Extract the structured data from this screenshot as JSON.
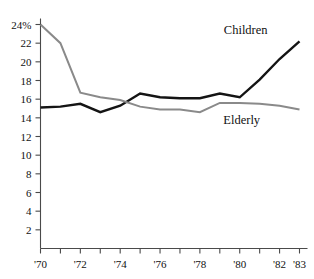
{
  "chart_data": {
    "type": "line",
    "title": "",
    "xlabel": "",
    "ylabel": "",
    "xlim": [
      1970,
      1983
    ],
    "ylim": [
      0,
      24
    ],
    "grid": false,
    "legend_position": "inline-right",
    "x": [
      1970,
      1971,
      1972,
      1973,
      1974,
      1975,
      1976,
      1977,
      1978,
      1979,
      1980,
      1981,
      1982,
      1983
    ],
    "x_tick_labels": [
      "'70",
      "",
      "'72",
      "",
      "'74",
      "",
      "'76",
      "",
      "'78",
      "",
      "'80",
      "",
      "'82",
      "'83"
    ],
    "y_tick_values": [
      2,
      4,
      6,
      8,
      10,
      12,
      14,
      16,
      18,
      20,
      22,
      24
    ],
    "y_tick_labels": [
      "2",
      "4",
      "6",
      "8",
      "10",
      "12",
      "14",
      "16",
      "18",
      "20",
      "22",
      "24%"
    ],
    "series": [
      {
        "name": "Children",
        "color": "#141414",
        "width": 2.4,
        "label": "Children",
        "values": [
          15.1,
          15.2,
          15.5,
          14.6,
          15.3,
          16.6,
          16.2,
          16.1,
          16.1,
          16.6,
          16.2,
          18.1,
          20.3,
          22.2
        ]
      },
      {
        "name": "Elderly",
        "color": "#8a8a8a",
        "width": 2.0,
        "label": "Elderly",
        "values": [
          24.0,
          22.0,
          16.7,
          16.2,
          15.9,
          15.2,
          14.9,
          14.9,
          14.6,
          15.6,
          15.6,
          15.5,
          15.3,
          14.9
        ]
      }
    ],
    "annotations": [
      {
        "text": "Children",
        "x": 1980.3,
        "y": 23.0,
        "name": "children-series-label"
      },
      {
        "text": "Elderly",
        "x": 1980.1,
        "y": 13.3,
        "name": "elderly-series-label"
      }
    ]
  },
  "colors": {
    "children": "#141414",
    "elderly": "#8a8a8a",
    "axis": "#4a4a4a",
    "background": "#ffffff",
    "text": "#111111"
  }
}
